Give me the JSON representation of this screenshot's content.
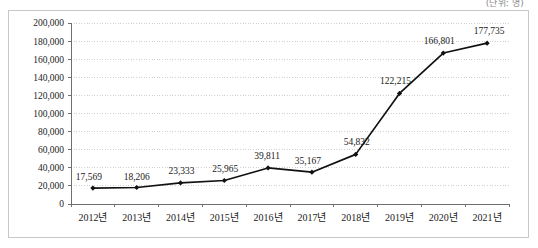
{
  "caption": {
    "unit_label": "(단위: 명)"
  },
  "chart_data": {
    "type": "line",
    "title": "",
    "subtitle": "",
    "xlabel": "",
    "ylabel": "",
    "categories": [
      "2012년",
      "2013년",
      "2014년",
      "2015년",
      "2016년",
      "2017년",
      "2018년",
      "2019년",
      "2020년",
      "2021년"
    ],
    "values": [
      17569,
      18206,
      23333,
      25965,
      39811,
      35167,
      54832,
      122215,
      166801,
      177735
    ],
    "point_labels": [
      "17,569",
      "18,206",
      "23,333",
      "25,965",
      "39,811",
      "35,167",
      "54,832",
      "122,215",
      "166,801",
      "177,735"
    ],
    "ylim": [
      0,
      200000
    ],
    "ytick_step": 20000,
    "ytick_labels": [
      "0",
      "20,000",
      "40,000",
      "60,000",
      "80,000",
      "100,000",
      "120,000",
      "140,000",
      "160,000",
      "180,000",
      "200,000"
    ],
    "ytick_values": [
      0,
      20000,
      40000,
      60000,
      80000,
      100000,
      120000,
      140000,
      160000,
      180000,
      200000
    ],
    "grid": true,
    "legend": false,
    "legend_position": "none",
    "series": [
      {
        "name": "",
        "values": [
          17569,
          18206,
          23333,
          25965,
          39811,
          35167,
          54832,
          122215,
          166801,
          177735
        ]
      }
    ],
    "colors": {
      "line": "#111111",
      "marker": "#111111",
      "grid": "#cfcfcf",
      "axis": "#6f6f6f",
      "frame": "#c8c8c8",
      "background": "#ffffff"
    }
  }
}
